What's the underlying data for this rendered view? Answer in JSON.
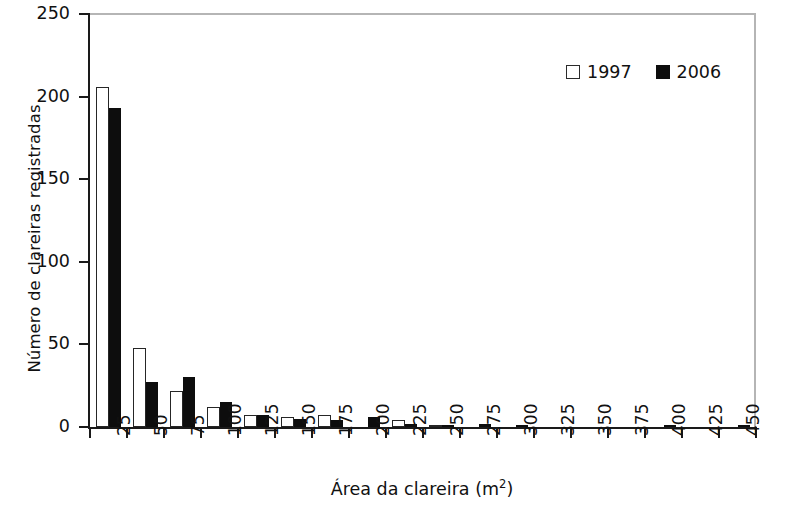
{
  "chart_data": {
    "type": "bar",
    "title": "",
    "xlabel": "Área da clareira (m²)",
    "xlabel_base": "Área da clareira (m",
    "xlabel_sup": "2",
    "xlabel_tail": ")",
    "ylabel": "Número de clareiras registradas",
    "categories": [
      "25",
      "50",
      "75",
      "100",
      "125",
      "150",
      "175",
      "200",
      "225",
      "250",
      "275",
      "300",
      "325",
      "350",
      "375",
      "400",
      "425",
      "450"
    ],
    "ylim": [
      0,
      250
    ],
    "yticks": [
      0,
      50,
      100,
      150,
      200,
      250
    ],
    "grid": false,
    "legend_position": "top-right",
    "series": [
      {
        "name": "1997",
        "color": "#ffffff",
        "edge_color": "#262626",
        "values": [
          206,
          48,
          22,
          12,
          7,
          6,
          7,
          0,
          4,
          1,
          0,
          0,
          0,
          0,
          0,
          0,
          0,
          0
        ]
      },
      {
        "name": "2006",
        "color": "#0d0d0d",
        "edge_color": "#0d0d0d",
        "values": [
          193,
          27,
          30,
          15,
          7,
          5,
          4,
          6,
          2,
          1,
          2,
          1,
          0,
          0,
          0,
          1,
          0,
          1
        ]
      }
    ]
  },
  "legend": {
    "items": [
      {
        "label": "1997",
        "swatch": "open-square-swatch"
      },
      {
        "label": "2006",
        "swatch": "filled-square-swatch"
      }
    ]
  }
}
